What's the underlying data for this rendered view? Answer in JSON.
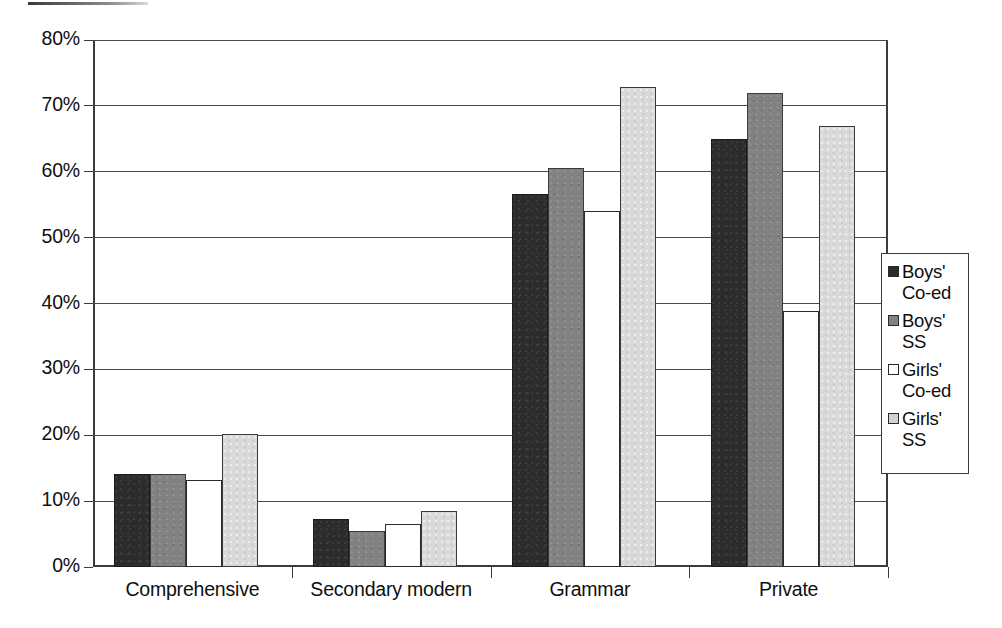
{
  "chart_data": {
    "type": "bar",
    "title": "",
    "xlabel": "",
    "ylabel": "",
    "ylim": [
      0,
      80
    ],
    "ytick_labels": [
      "0%",
      "10%",
      "20%",
      "30%",
      "40%",
      "50%",
      "60%",
      "70%",
      "80%"
    ],
    "ytick_values": [
      0,
      10,
      20,
      30,
      40,
      50,
      60,
      70,
      80
    ],
    "grid": true,
    "legend_position": "right",
    "categories": [
      "Comprehensive",
      "Secondary modern",
      "Grammar",
      "Private"
    ],
    "series": [
      {
        "name": "Boys' Co-ed",
        "color": "#2c2c2c",
        "values": [
          14.1,
          7.3,
          56.6,
          64.9
        ]
      },
      {
        "name": "Boys' SS",
        "color": "#828282",
        "values": [
          14.1,
          5.5,
          60.6,
          71.9
        ]
      },
      {
        "name": "Girls' Co-ed",
        "color": "#ffffff",
        "values": [
          13.2,
          6.5,
          54.0,
          38.9
        ]
      },
      {
        "name": "Girls' SS",
        "color": "#d9d9d9",
        "values": [
          20.2,
          8.5,
          72.9,
          66.9
        ]
      }
    ]
  },
  "legend": {
    "items": [
      {
        "label": "Boys'\nCo-ed",
        "swatch": "black-swatch"
      },
      {
        "label": "Boys'\nSS",
        "swatch": "dark-gray-swatch"
      },
      {
        "label": "Girls'\nCo-ed",
        "swatch": "white-swatch"
      },
      {
        "label": "Girls'\nSS",
        "swatch": "light-gray-swatch"
      }
    ]
  }
}
